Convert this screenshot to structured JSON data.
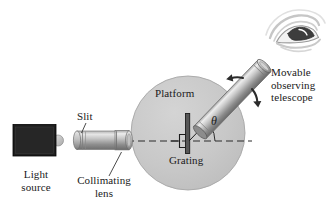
{
  "figure": {
    "background": "#ffffff",
    "width": 330,
    "height": 221
  },
  "colors": {
    "platform_fill": "#c9c9c9",
    "platform_stroke": "#9a9a9a",
    "tube_light": "#e8e8e8",
    "tube_mid": "#9d9d9d",
    "tube_dark": "#6e6e6e",
    "light_source_body": "#1c1c1c",
    "grating_dark": "#4a4a4a",
    "line_dark": "#1a1a1a",
    "eye_stroke": "#bdbdbd",
    "text": "#1a1a1a"
  },
  "labels": {
    "light_source": {
      "line1": "Light",
      "line2": "source"
    },
    "slit": "Slit",
    "collimating_lens": {
      "line1": "Collimating",
      "line2": "lens"
    },
    "platform": "Platform",
    "grating": "Grating",
    "angle_symbol": "θ",
    "telescope": {
      "line1": "Movable",
      "line2": "observing",
      "line3": "telescope"
    }
  },
  "components": {
    "light_source": {
      "name": "light-source-box",
      "x": 13,
      "y": 125,
      "w": 43,
      "h": 31
    },
    "lamp_bulb": {
      "name": "lamp-bulb",
      "cx": 57,
      "cy": 140,
      "r": 5
    },
    "collimator_tube": {
      "name": "collimating-tube",
      "x": 72,
      "y": 131,
      "w": 62,
      "h": 18
    },
    "platform": {
      "name": "platform-disc",
      "cx": 188,
      "cy": 133,
      "r": 57
    },
    "grating": {
      "name": "grating-plate",
      "x": 186,
      "y": 114,
      "w": 4,
      "h": 40
    },
    "optical_axis": {
      "name": "optical-axis-dashed",
      "x1": 128,
      "y1": 141,
      "x2": 252,
      "y2": 141
    },
    "telescope": {
      "name": "telescope-tube",
      "x1": 192,
      "y1": 140,
      "x2": 272,
      "y2": 58,
      "thickness": 17
    },
    "eye": {
      "name": "observer-eye",
      "cx": 295,
      "cy": 27
    },
    "rotation_arrows": {
      "name": "rotation-arrows",
      "note": "double arrow across telescope axis"
    }
  },
  "angle": {
    "symbol": "θ",
    "vertex_x": 190,
    "vertex_y": 141,
    "measured_from": "optical-axis",
    "measured_to": "telescope-axis"
  }
}
